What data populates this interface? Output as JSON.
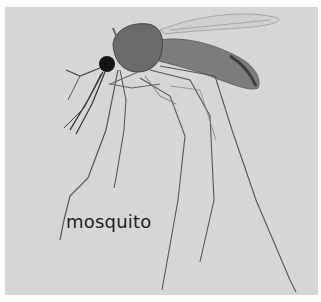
{
  "image": {
    "subject": "mosquito",
    "style": "grayscale photograph",
    "background_color": "#d6d6d6",
    "border_color": "#ffffff"
  },
  "caption": {
    "text": "mosquito"
  }
}
